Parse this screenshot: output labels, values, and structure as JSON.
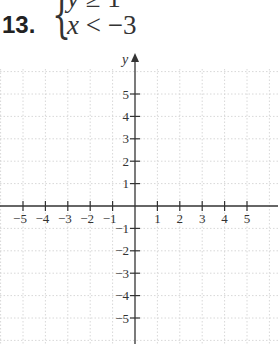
{
  "problem": {
    "number": "13.",
    "system": [
      {
        "lhs": "y",
        "op": "≥",
        "rhs": "1"
      },
      {
        "lhs": "x",
        "op": "<",
        "rhs": "−3"
      }
    ]
  },
  "graph": {
    "x_axis_label": "x",
    "y_axis_label": "y",
    "x_ticks": [
      "−5",
      "−4",
      "−3",
      "−2",
      "−1",
      "1",
      "2",
      "3",
      "4",
      "5"
    ],
    "y_ticks": [
      "5",
      "4",
      "3",
      "2",
      "1",
      "−1",
      "−2",
      "−3",
      "−4",
      "−5"
    ],
    "grid": "dotted",
    "grid_color": "#d8d8d8",
    "axis_color": "#333333",
    "range": {
      "x": [
        -6,
        6
      ],
      "y": [
        -6,
        6
      ]
    }
  }
}
